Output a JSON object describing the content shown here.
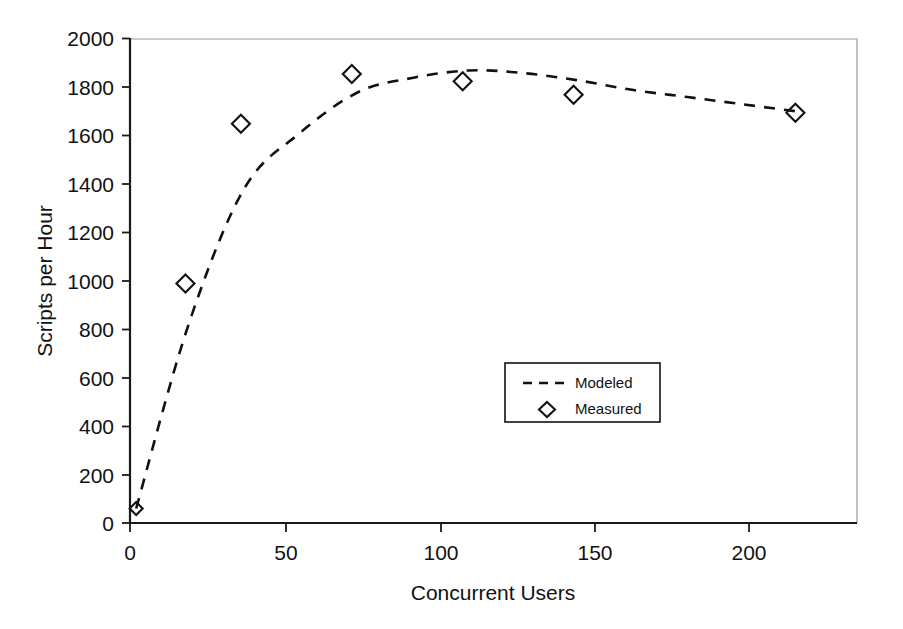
{
  "chart_data": {
    "type": "scatter",
    "title": "",
    "xlabel": "Concurrent Users",
    "ylabel": "Scripts per Hour",
    "xlim": [
      0,
      236
    ],
    "ylim": [
      0,
      2000
    ],
    "xticks": [
      0,
      50,
      100,
      150,
      200
    ],
    "yticks": [
      0,
      200,
      400,
      600,
      800,
      1000,
      1200,
      1400,
      1600,
      1800,
      2000
    ],
    "xtick_labels": [
      "0",
      "50",
      "100",
      "150",
      "200"
    ],
    "ytick_labels": [
      "0",
      "200",
      "400",
      "600",
      "800",
      "1000",
      "1200",
      "1400",
      "1600",
      "1800",
      "2000"
    ],
    "grid": false,
    "legend_position": "center-right",
    "series": [
      {
        "name": "Modeled",
        "style": "dashed-line",
        "marker": "none",
        "color": "#111111",
        "x": [
          2,
          19,
          37,
          55,
          74,
          92,
          110,
          127,
          145,
          163,
          181,
          199,
          217
        ],
        "y": [
          60,
          820,
          1380,
          1610,
          1780,
          1840,
          1870,
          1860,
          1830,
          1790,
          1760,
          1730,
          1700
        ]
      },
      {
        "name": "Measured",
        "style": "markers",
        "marker": "diamond",
        "color": "#111111",
        "x": [
          2,
          18,
          36,
          72,
          108,
          144,
          216
        ],
        "y": [
          60,
          990,
          1650,
          1855,
          1825,
          1770,
          1695
        ]
      }
    ],
    "legend_entries": [
      {
        "label": "Modeled",
        "glyph": "dashed-line"
      },
      {
        "label": "Measured",
        "glyph": "diamond-marker"
      }
    ]
  }
}
